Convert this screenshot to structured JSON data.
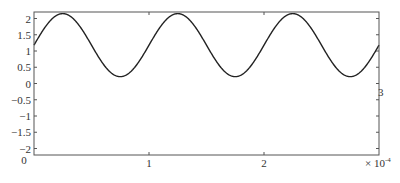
{
  "chart_data": {
    "type": "line",
    "title": "",
    "xlabel": "",
    "ylabel": "",
    "x_multiplier_label": "× 10",
    "x_multiplier_exponent": "-4",
    "xlim": [
      0,
      3
    ],
    "ylim": [
      -2.2,
      2.2
    ],
    "grid": false,
    "legend": null,
    "x_ticks": [
      {
        "value": 1,
        "label": "1"
      },
      {
        "value": 2,
        "label": "2"
      }
    ],
    "x_origin_label": "0",
    "y_ticks": [
      {
        "value": 2,
        "label": "2"
      },
      {
        "value": 1.5,
        "label": "1.5"
      },
      {
        "value": 1,
        "label": "1"
      },
      {
        "value": 0.5,
        "label": "0.5"
      },
      {
        "value": 0,
        "label": "0"
      },
      {
        "value": -0.5,
        "label": "−0.5"
      },
      {
        "value": -1,
        "label": "−1"
      },
      {
        "value": -1.5,
        "label": "−1.5"
      },
      {
        "value": -2,
        "label": "−2"
      }
    ],
    "stray_label": {
      "text": "3",
      "x": 3,
      "y": -0.2
    },
    "series": [
      {
        "name": "signal",
        "color": "#222222",
        "model": "y = 1.18 + 0.97*sin(2*pi*x/1 - 0)",
        "x": [
          0,
          0.25,
          0.5,
          0.75,
          1.0,
          1.25,
          1.5,
          1.75,
          2.0,
          2.25,
          2.5,
          2.75,
          3.0
        ],
        "y": [
          1.18,
          2.15,
          1.18,
          0.21,
          1.18,
          2.15,
          1.18,
          0.21,
          1.18,
          2.15,
          1.18,
          0.21,
          1.18
        ]
      }
    ]
  }
}
